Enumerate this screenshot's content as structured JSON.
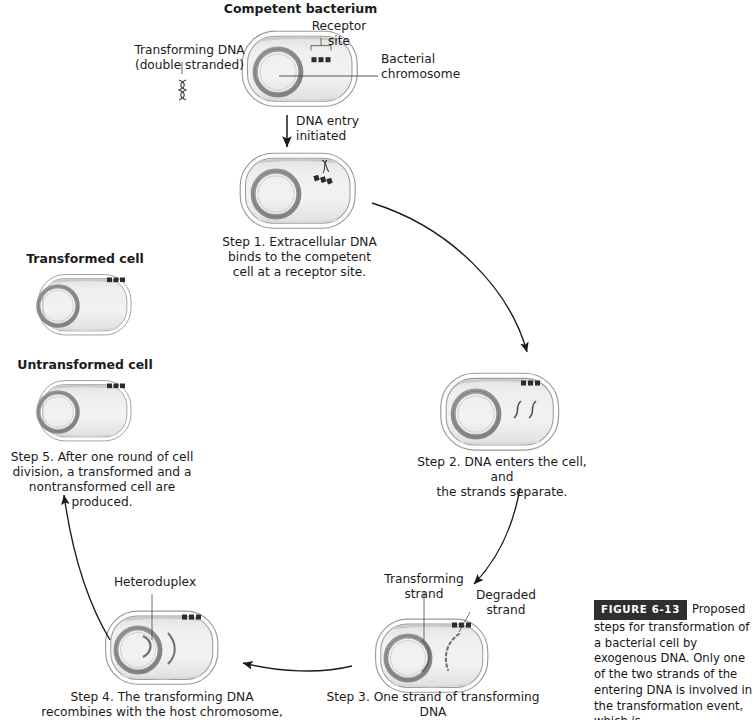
{
  "figure": {
    "title": "Proposed steps for transformation of a bacterial cell by exogenous DNA",
    "badge_label": "FIGURE 6-13",
    "caption_text": "Proposed steps for transformation of a bacterial cell by exogenous DNA. Only one of the two strands of the entering DNA is involved in the transformation event, which is"
  },
  "labels": {
    "competent_bacterium": "Competent bacterium",
    "receptor_site": "Receptor\nsite",
    "transforming_dna": "Transforming DNA\n(double stranded)",
    "bacterial_chromosome": "Bacterial\nchromosome",
    "dna_entry_initiated": "DNA entry\ninitiated",
    "transformed_cell": "Transformed cell",
    "untransformed_cell": "Untransformed cell",
    "heteroduplex": "Heteroduplex",
    "transforming_strand": "Transforming\nstrand",
    "degraded_strand": "Degraded\nstrand"
  },
  "steps": [
    {
      "id": "step1",
      "text": "Step 1. Extracellular DNA\nbinds to the competent\ncell at a receptor site."
    },
    {
      "id": "step2",
      "text": "Step 2. DNA enters the cell, and\nthe strands separate."
    },
    {
      "id": "step3",
      "text": "Step 3. One strand of transforming DNA\nis degraded; the other strand pairs"
    },
    {
      "id": "step4",
      "text": "Step 4. The transforming DNA\nrecombines with the host chromosome,\nreplacing its homologous region,"
    },
    {
      "id": "step5",
      "text": "Step 5. After one round of cell\ndivision, a transformed and a\nnontransformed cell are produced."
    }
  ],
  "colors": {
    "cell_fill": "#ededed",
    "cell_outline": "#8a8a8a",
    "chromosome": "#8e8e8e",
    "receptor_dot": "#2b2b2b",
    "arrow": "#1a1a1a",
    "text": "#1b1b1b",
    "badge_bg": "#2f2f2f"
  }
}
